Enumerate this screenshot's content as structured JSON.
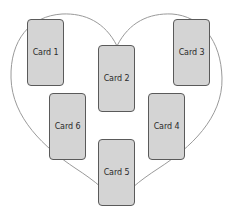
{
  "diagram": {
    "shape": "heart",
    "outline_color": "#9a9a9a",
    "card_fill": "#d4d4d4",
    "card_border": "#5a5a5a",
    "cards": [
      {
        "id": 1,
        "label": "Card 1",
        "x": 27,
        "y": 19
      },
      {
        "id": 2,
        "label": "Card 2",
        "x": 98,
        "y": 45
      },
      {
        "id": 3,
        "label": "Card 3",
        "x": 173,
        "y": 19
      },
      {
        "id": 4,
        "label": "Card 4",
        "x": 148,
        "y": 93
      },
      {
        "id": 5,
        "label": "Card 5",
        "x": 98,
        "y": 139
      },
      {
        "id": 6,
        "label": "Card 6",
        "x": 49,
        "y": 93
      }
    ]
  }
}
